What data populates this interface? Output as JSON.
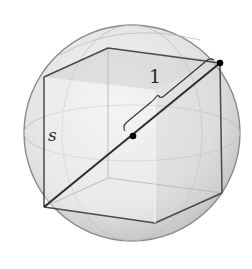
{
  "figure": {
    "labels": {
      "radius": "1",
      "side": "s"
    },
    "colors": {
      "background": "#ffffff",
      "sphere_fill": "#e4e4e4",
      "sphere_edge": "#8a8a8a",
      "cube_edge": "#4a4a4a",
      "diagonal": "#2e2e2e",
      "point": "#000000"
    }
  }
}
